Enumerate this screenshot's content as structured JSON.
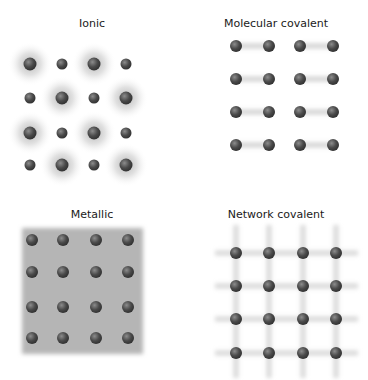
{
  "panels": [
    {
      "id": "ionic",
      "title": "Ionic"
    },
    {
      "id": "molecular",
      "title": "Molecular covalent"
    },
    {
      "id": "metallic",
      "title": "Metallic"
    },
    {
      "id": "network",
      "title": "Network covalent"
    }
  ],
  "colors": {
    "atom_dark": "#3c3c3c",
    "atom_light": "#8a8a8a",
    "halo": "#9a9a9a",
    "bond": "#d6d6d6",
    "metal_sea": "#b8b8b8"
  }
}
